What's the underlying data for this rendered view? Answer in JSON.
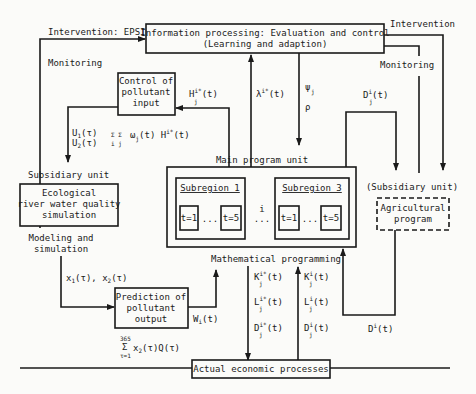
{
  "diagram": {
    "top_box": {
      "line1": "Information processing: Evaluation and control",
      "line2": "(Learning and adaption)"
    },
    "labels": {
      "intervention_epsi": "Intervention: EPSI",
      "monitoring_left": "Monitoring",
      "intervention_right": "Intervention",
      "monitoring_right": "Monitoring",
      "main_program_unit": "Main program unit",
      "subsidiary_unit": "Subsidiary unit",
      "subsidiary_unit_right": "(Subsidiary unit)",
      "modeling_1": "Modeling and",
      "modeling_2": "simulation",
      "mathematical_programming": "Mathematical programming"
    },
    "control_box": {
      "line1": "Control of",
      "line2": "pollutant",
      "line3": "input"
    },
    "eco_box": {
      "line1": "Ecological",
      "line2": "river water quality",
      "line3": "simulation"
    },
    "prediction_box": {
      "line1": "Prediction of",
      "line2": "pollutant",
      "line3": "output"
    },
    "agri_box": {
      "line1": "Agricultural",
      "line2": "program"
    },
    "economic_box": {
      "label": "Actual economic processes"
    },
    "subregions": [
      {
        "title": "Subregion 1",
        "t_start": "t=1",
        "dots": "...",
        "t_end": "t=5"
      },
      {
        "title": "Subregion 3",
        "t_start": "t=1",
        "dots": "...",
        "t_end": "t=5"
      }
    ],
    "between_subregions": {
      "index": "i",
      "dots": "..."
    },
    "symbols": {
      "H": "H",
      "H_sup": "i*",
      "H_sub": "j",
      "H_arg": "(t)",
      "lambda": "λ",
      "lambda_sup": "i*",
      "lambda_arg": "(t)",
      "psi": "ψ",
      "psi_sub": "j",
      "rho": "ρ",
      "D_top": "D",
      "D_top_sup": "i",
      "D_top_sub": "j",
      "D_top_arg": "(t)",
      "U1": "U",
      "U1_sub": "1",
      "U1_arg": "(τ)",
      "U2": "U",
      "U2_sub": "2",
      "U2_arg": "(τ)",
      "sum_sym": "Σ Σ",
      "sum_idx": "i  j",
      "sum_expr": "ω",
      "sum_w_sub": "j",
      "sum_w_arg": "(t) H",
      "sum_H_sup": "i*",
      "sum_H_sub": "j",
      "sum_H_arg": "(t)",
      "x_label": "x",
      "x1_sub": "1",
      "x_mid": "(τ), x",
      "x2_sub": "2",
      "x_end": "(τ)",
      "W": "W",
      "W_sub": "i",
      "W_arg": "(t)",
      "sum365_top": "365",
      "sum365_sym": "Σ",
      "sum365_bot": "τ=1",
      "sum365_x": "x",
      "sum365_x_sub": "2",
      "sum365_expr": "(τ)Q(τ)",
      "K_star": "K",
      "L_star": "L",
      "D_star": "D",
      "star_sup": "i*",
      "star_sub": "j",
      "star_arg": "(t)",
      "K_plain": "K",
      "L_plain": "L",
      "D_plain": "D",
      "plain_sup": "i",
      "plain_sub": "j",
      "plain_arg": "(t)",
      "D_bottom": "D",
      "D_bottom_sup": "i",
      "D_bottom_arg": "(t)"
    }
  }
}
